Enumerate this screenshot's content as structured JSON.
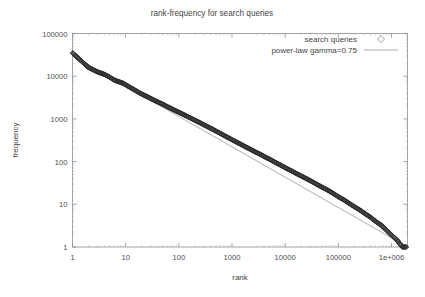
{
  "chart_data": {
    "type": "scatter",
    "title": "rank-frequency for search queries",
    "xlabel": "rank",
    "ylabel": "frequency",
    "xscale": "log",
    "yscale": "log",
    "xlim": [
      1,
      2000000
    ],
    "ylim": [
      1,
      100000
    ],
    "grid": false,
    "legend_position": "top-right",
    "xticks": [
      "1",
      "10",
      "100",
      "1000",
      "10000",
      "100000",
      "1e+006"
    ],
    "xtick_values": [
      1,
      10,
      100,
      1000,
      10000,
      100000,
      1000000
    ],
    "yticks": [
      "1",
      "10",
      "100",
      "1000",
      "10000",
      "100000"
    ],
    "ytick_values": [
      1,
      10,
      100,
      1000,
      10000,
      100000
    ],
    "series": [
      {
        "name": "search queries",
        "marker": "diamond",
        "color": "#2a2a2a",
        "description": "empirical rank-frequency distribution of search queries, approximately 1.8 million ranks, frequency decaying from about 35000 at rank 1 to 1 at the highest ranks",
        "points": [
          [
            1,
            35000
          ],
          [
            2,
            16000
          ],
          [
            3,
            12500
          ],
          [
            4,
            11000
          ],
          [
            5,
            9500
          ],
          [
            6,
            8200
          ],
          [
            7,
            7600
          ],
          [
            8,
            7200
          ],
          [
            9,
            6800
          ],
          [
            10,
            6300
          ],
          [
            12,
            5500
          ],
          [
            15,
            4700
          ],
          [
            18,
            4100
          ],
          [
            22,
            3600
          ],
          [
            27,
            3200
          ],
          [
            33,
            2800
          ],
          [
            40,
            2500
          ],
          [
            50,
            2200
          ],
          [
            60,
            1950
          ],
          [
            75,
            1700
          ],
          [
            90,
            1520
          ],
          [
            110,
            1350
          ],
          [
            135,
            1190
          ],
          [
            165,
            1050
          ],
          [
            200,
            930
          ],
          [
            250,
            810
          ],
          [
            300,
            720
          ],
          [
            380,
            620
          ],
          [
            470,
            540
          ],
          [
            580,
            470
          ],
          [
            720,
            405
          ],
          [
            900,
            350
          ],
          [
            1100,
            305
          ],
          [
            1400,
            262
          ],
          [
            1700,
            230
          ],
          [
            2200,
            195
          ],
          [
            2700,
            170
          ],
          [
            3400,
            148
          ],
          [
            4200,
            128
          ],
          [
            5200,
            112
          ],
          [
            6500,
            96
          ],
          [
            8000,
            84
          ],
          [
            10000,
            72
          ],
          [
            13000,
            61
          ],
          [
            16000,
            53
          ],
          [
            20000,
            46
          ],
          [
            26000,
            39
          ],
          [
            32000,
            34
          ],
          [
            40000,
            29
          ],
          [
            50000,
            25
          ],
          [
            65000,
            21
          ],
          [
            80000,
            18
          ],
          [
            100000,
            15
          ],
          [
            130000,
            12.5
          ],
          [
            160000,
            10.5
          ],
          [
            200000,
            8.8
          ],
          [
            260000,
            7.2
          ],
          [
            320000,
            6.0
          ],
          [
            400000,
            5.0
          ],
          [
            500000,
            4.0
          ],
          [
            650000,
            3.2
          ],
          [
            800000,
            2.5
          ],
          [
            1000000,
            1.9
          ],
          [
            1300000,
            1.4
          ],
          [
            1600000,
            1.0
          ],
          [
            1900000,
            1.0
          ]
        ]
      },
      {
        "name": "power-law gamma=0.75",
        "marker": "line",
        "color": "#9a9a9a",
        "gamma": 0.75,
        "description": "fitted power-law reference line with exponent gamma = 0.75 spanning rank 1 to 2e+006",
        "fit_endpoints": [
          [
            1,
            30000
          ],
          [
            2000000,
            1.0
          ]
        ]
      }
    ]
  },
  "legend": {
    "entries": [
      {
        "label": "search queries",
        "marker": "diamond-marker"
      },
      {
        "label": "power-law gamma=0.75",
        "marker": "line-marker"
      }
    ]
  }
}
